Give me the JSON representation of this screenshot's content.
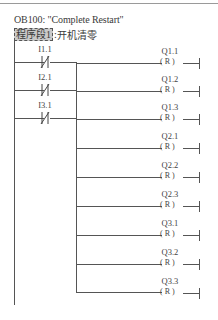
{
  "header": {
    "block_title": "OB100:  \"Complete Restart\"",
    "network_label": "程序段1",
    "network_separator": ":",
    "network_comment": "开机清零"
  },
  "diagram": {
    "type": "ladder-logic",
    "left_rail": true,
    "contacts": [
      {
        "address": "I1.1",
        "type": "normally-closed"
      },
      {
        "address": "I2.1",
        "type": "normally-closed"
      },
      {
        "address": "I3.1",
        "type": "normally-closed"
      }
    ],
    "coils": [
      {
        "address": "Q1.1",
        "instruction": "(R)"
      },
      {
        "address": "Q1.2",
        "instruction": "(R)"
      },
      {
        "address": "Q1.3",
        "instruction": "(R)"
      },
      {
        "address": "Q2.1",
        "instruction": "(R)"
      },
      {
        "address": "Q2.2",
        "instruction": "(R)"
      },
      {
        "address": "Q2.3",
        "instruction": "(R)"
      },
      {
        "address": "Q3.1",
        "instruction": "(R)"
      },
      {
        "address": "Q3.2",
        "instruction": "(R)"
      },
      {
        "address": "Q3.3",
        "instruction": "(R)"
      }
    ],
    "coil_symbol": "( R )"
  }
}
